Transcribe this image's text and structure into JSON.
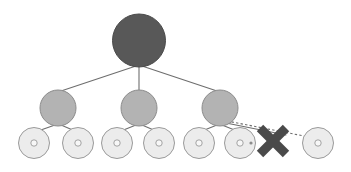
{
  "canvas": {
    "width": 351,
    "height": 172,
    "background": "#ffffff"
  },
  "diagram": {
    "type": "tree-diagram",
    "title": "",
    "levels": 3
  },
  "palette": {
    "root_fill": "#585858",
    "root_stroke": "#4a4a4a",
    "internal_fill": "#b3b3b3",
    "internal_stroke": "#8c8c8c",
    "leaf_fill": "#ececec",
    "leaf_stroke": "#9a9a9a",
    "leaf_dot_stroke": "#9a9a9a",
    "leaf_dot_fill": "#f7f7f7",
    "edge_stroke": "#6e6e6e",
    "dashed_stroke": "#6e6e6e",
    "marker_fill": "#4a4a4a",
    "marker_stroke": "#3c3c3c",
    "dot_fill": "#8c8c8c"
  },
  "geometry": {
    "root": {
      "cx": 139,
      "cy": 40.5,
      "r": 26.5
    },
    "internal_radius": 18,
    "leaf_radius": 15.5,
    "leaf_inner_radius": 3.2,
    "edge_width": 1.1,
    "dashed_width": 1.1,
    "dash_pattern": "2.4 2.2",
    "marker": {
      "cx": 273,
      "cy": 141,
      "half": 13,
      "stroke_width": 9
    },
    "small_dot": {
      "cx": 251,
      "cy": 143,
      "r": 1.6
    }
  },
  "nodes": {
    "root": {
      "id": "root",
      "label": "",
      "cx": 139,
      "cy": 40.5,
      "r": 26.5,
      "kind": "root"
    },
    "internal": [
      {
        "id": "internal-1",
        "label": "",
        "cx": 58,
        "cy": 108,
        "r": 18,
        "kind": "internal"
      },
      {
        "id": "internal-2",
        "label": "",
        "cx": 139,
        "cy": 108,
        "r": 18,
        "kind": "internal"
      },
      {
        "id": "internal-3",
        "label": "",
        "cx": 220,
        "cy": 108,
        "r": 18,
        "kind": "internal"
      }
    ],
    "leaves": [
      {
        "id": "leaf-1",
        "label": "",
        "cx": 34,
        "cy": 143,
        "r": 15.5,
        "kind": "leaf",
        "parent": "internal-1"
      },
      {
        "id": "leaf-2",
        "label": "",
        "cx": 78,
        "cy": 143,
        "r": 15.5,
        "kind": "leaf",
        "parent": "internal-1"
      },
      {
        "id": "leaf-3",
        "label": "",
        "cx": 117,
        "cy": 143,
        "r": 15.5,
        "kind": "leaf",
        "parent": "internal-2"
      },
      {
        "id": "leaf-4",
        "label": "",
        "cx": 159,
        "cy": 143,
        "r": 15.5,
        "kind": "leaf",
        "parent": "internal-2"
      },
      {
        "id": "leaf-5",
        "label": "",
        "cx": 199,
        "cy": 143,
        "r": 15.5,
        "kind": "leaf",
        "parent": "internal-3"
      },
      {
        "id": "leaf-6",
        "label": "",
        "cx": 240,
        "cy": 143,
        "r": 15.5,
        "kind": "leaf",
        "parent": "internal-3"
      },
      {
        "id": "leaf-7",
        "label": "",
        "cx": 318,
        "cy": 143,
        "r": 15.5,
        "kind": "leaf",
        "parent": "internal-3"
      }
    ]
  },
  "edges": {
    "solid": [
      {
        "id": "edge-root-internal-1",
        "x1": 136,
        "y1": 66,
        "x2": 61,
        "y2": 91,
        "style": "solid"
      },
      {
        "id": "edge-root-internal-2",
        "x1": 139,
        "y1": 67,
        "x2": 139,
        "y2": 90,
        "style": "solid"
      },
      {
        "id": "edge-root-internal-3",
        "x1": 142,
        "y1": 66,
        "x2": 217,
        "y2": 91,
        "style": "solid"
      },
      {
        "id": "edge-internal-1-leaf-1",
        "x1": 55,
        "y1": 125,
        "x2": 38,
        "y2": 131,
        "style": "solid"
      },
      {
        "id": "edge-internal-1-leaf-2",
        "x1": 61,
        "y1": 125,
        "x2": 75,
        "y2": 131,
        "style": "solid"
      },
      {
        "id": "edge-internal-2-leaf-3",
        "x1": 136,
        "y1": 125,
        "x2": 121,
        "y2": 131,
        "style": "solid"
      },
      {
        "id": "edge-internal-2-leaf-4",
        "x1": 142,
        "y1": 125,
        "x2": 156,
        "y2": 131,
        "style": "solid"
      },
      {
        "id": "edge-internal-3-leaf-5",
        "x1": 217,
        "y1": 125,
        "x2": 202,
        "y2": 131,
        "style": "solid"
      },
      {
        "id": "edge-internal-3-leaf-6",
        "x1": 222,
        "y1": 125,
        "x2": 237,
        "y2": 131,
        "style": "solid"
      },
      {
        "id": "edge-internal-3-blocked",
        "x1": 226,
        "y1": 123,
        "x2": 286,
        "y2": 135,
        "style": "solid"
      }
    ],
    "dashed": [
      {
        "id": "edge-internal-3-leaf-7-dashed",
        "x1": 227,
        "y1": 121,
        "x2": 304,
        "y2": 136,
        "style": "dashed"
      }
    ]
  },
  "markers": [
    {
      "id": "blocked-marker",
      "name": "x-mark",
      "cx": 273,
      "cy": 141,
      "label": "",
      "meaning": "blocked"
    }
  ]
}
